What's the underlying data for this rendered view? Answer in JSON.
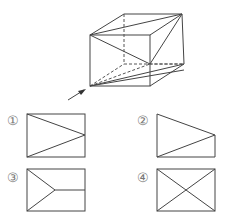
{
  "figure": {
    "type": "cube-section-view-question",
    "view_arrow": "front-left-bottom",
    "options": [
      {
        "label": "①",
        "description": "rectangle with two lines from left corners meeting at right-edge midpoint"
      },
      {
        "label": "②",
        "description": "trapezoid with diagonal from bottom-left to upper-right vertex"
      },
      {
        "label": "③",
        "description": "rectangle with lines from left corners meeting at interior point, plus horizontal line to right edge"
      },
      {
        "label": "④",
        "description": "rectangle with both diagonals"
      }
    ]
  },
  "colors": {
    "line": "#444444",
    "label": "#777777",
    "background": "#ffffff"
  }
}
